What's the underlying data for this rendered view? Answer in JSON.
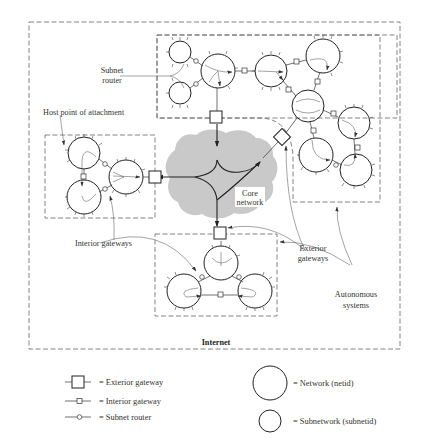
{
  "diagram": {
    "outer_boundary_label": "Internet",
    "core": {
      "label_line1": "Core",
      "label_line2": "network",
      "fill": "#c8c8c8"
    },
    "annotations": {
      "subnet_router": {
        "line1": "Subnet",
        "line2": "router"
      },
      "host_point": "Host point of attachment",
      "interior_gateways": "Interior gateways",
      "exterior_gateways": {
        "line1": "Exterior",
        "line2": "gateways"
      },
      "autonomous_systems": {
        "line1": "Autonomous",
        "line2": "systems"
      }
    },
    "autonomous_systems": [
      {
        "id": "top",
        "networks": 9,
        "exterior_gateways": 2
      },
      {
        "id": "left",
        "networks": 3,
        "exterior_gateways": 1
      },
      {
        "id": "bottom",
        "networks": 3,
        "exterior_gateways": 1
      }
    ]
  },
  "legend": {
    "exterior_gateway": "= Exterior gateway",
    "interior_gateway": "= Interior gateway",
    "subnet_router": "= Subnet router",
    "network": "= Network (netid)",
    "subnetwork": "= Subnetwork (subnetid)"
  }
}
